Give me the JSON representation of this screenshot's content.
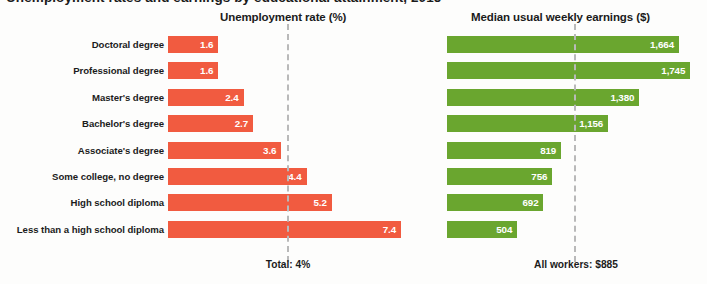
{
  "title_partial": "Unemployment rates and earnings by educational attainment, 2015",
  "footer": {
    "unemployment_total": "Total: 4%",
    "earnings_total": "All workers: $885"
  },
  "colors": {
    "unemployment_bar": "#f15b40",
    "earnings_bar": "#6aa62f",
    "reference_line": "#b9b9b9",
    "text": "#1b1b1b",
    "background": "#fdfdfc"
  },
  "chart_data": {
    "type": "bar",
    "title": "Unemployment rates and earnings by educational attainment, 2015",
    "orientation": "horizontal",
    "grid": false,
    "legend_position": "none",
    "categories": [
      "Doctoral degree",
      "Professional degree",
      "Master's degree",
      "Bachelor's degree",
      "Associate's degree",
      "Some college, no degree",
      "High school diploma",
      "Less than a high school diploma"
    ],
    "panels": [
      {
        "name": "unemployment",
        "header": "Unemployment rate (%)",
        "xlabel": "Unemployment rate (%)",
        "ylabel": "",
        "xlim": [
          0,
          8.0
        ],
        "values": [
          1.6,
          1.6,
          2.4,
          2.7,
          3.6,
          4.4,
          5.2,
          7.4
        ],
        "value_labels": [
          "1.6",
          "1.6",
          "2.4",
          "2.7",
          "3.6",
          "4.4",
          "5.2",
          "7.4"
        ],
        "reference_line": {
          "value": 4,
          "label": "Total: 4%",
          "style": "dashed"
        },
        "color": "#f15b40"
      },
      {
        "name": "earnings",
        "header": "Median usual weekly earnings ($)",
        "xlabel": "Median usual weekly earnings ($)",
        "ylabel": "",
        "xlim": [
          0,
          1800
        ],
        "values": [
          1664,
          1745,
          1380,
          1156,
          819,
          756,
          692,
          504
        ],
        "value_labels": [
          "1,664",
          "1,745",
          "1,380",
          "1,156",
          "819",
          "756",
          "692",
          "504"
        ],
        "reference_line": {
          "value": 885,
          "label": "All workers: $885",
          "style": "dashed"
        },
        "color": "#6aa62f"
      }
    ]
  }
}
